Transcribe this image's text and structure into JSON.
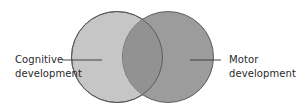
{
  "diagram": {
    "type": "venn",
    "sets": [
      {
        "id": "cognitive",
        "label_line1": "Cognitive",
        "label_line2": "development",
        "fill": "#c6c6c6",
        "position": "left"
      },
      {
        "id": "motor",
        "label_line1": "Motor",
        "label_line2": "development",
        "fill": "#9c9c9c",
        "position": "right"
      }
    ],
    "overlap_fill": "#929292",
    "stroke": "#555555"
  }
}
